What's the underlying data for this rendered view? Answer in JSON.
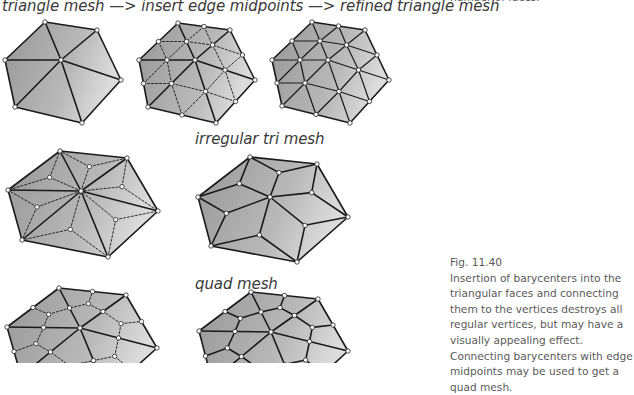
{
  "figure": {
    "title": "triangle mesh —> insert edge midpoints —> refined triangle mesh",
    "label_irregular": "irregular tri mesh",
    "label_quad": "quad mesh",
    "caption_top_fragment": "number of faces.",
    "caption_number": "Fig. 11.40",
    "caption_text": "Insertion of barycenters into the triangular faces and connecting them to the vertices destroys all regular vertices, but may have a visually appealing effect. Connecting barycenters with edge midpoints may be used to get a quad mesh.",
    "colors": {
      "face_dark": "#9a9a9a",
      "face_light": "#d6d6d6",
      "edge": "#1a1a1a",
      "vertex_fill": "#ffffff"
    }
  },
  "meshes": [
    {
      "name": "triangle-mesh",
      "type": "tri",
      "center": [
        61,
        60
      ],
      "hex": [
        [
          45,
          22
        ],
        [
          97,
          30
        ],
        [
          121,
          80
        ],
        [
          82,
          123
        ],
        [
          15,
          107
        ],
        [
          5,
          60
        ]
      ]
    },
    {
      "name": "midpoint-mesh",
      "type": "mid",
      "center": [
        195,
        60
      ],
      "hex": [
        [
          178,
          23
        ],
        [
          230,
          30
        ],
        [
          255,
          80
        ],
        [
          216,
          123
        ],
        [
          148,
          107
        ],
        [
          139,
          60
        ]
      ]
    },
    {
      "name": "refined-triangle-mesh",
      "type": "refined",
      "center": [
        328,
        60
      ],
      "hex": [
        [
          312,
          22
        ],
        [
          365,
          30
        ],
        [
          389,
          80
        ],
        [
          350,
          123
        ],
        [
          282,
          106
        ],
        [
          272,
          60
        ]
      ]
    },
    {
      "name": "barycenter-dashed-mesh",
      "type": "bary-dashed",
      "center": [
        81,
        191
      ],
      "hex": [
        [
          60,
          151
        ],
        [
          127,
          158
        ],
        [
          158,
          211
        ],
        [
          108,
          257
        ],
        [
          22,
          240
        ],
        [
          8,
          190
        ]
      ]
    },
    {
      "name": "irregular-tri-mesh",
      "type": "bary",
      "center": [
        270,
        197
      ],
      "hex": [
        [
          250,
          157
        ],
        [
          317,
          164
        ],
        [
          348,
          217
        ],
        [
          297,
          262
        ],
        [
          211,
          246
        ],
        [
          198,
          197
        ]
      ]
    },
    {
      "name": "quad-dashed-mesh",
      "type": "quad-dashed",
      "center": [
        80,
        328
      ],
      "hex": [
        [
          59,
          288
        ],
        [
          126,
          295
        ],
        [
          157,
          348
        ],
        [
          107,
          393
        ],
        [
          21,
          376
        ],
        [
          7,
          327
        ]
      ]
    },
    {
      "name": "quad-mesh",
      "type": "quad",
      "center": [
        271,
        332
      ],
      "hex": [
        [
          251,
          292
        ],
        [
          318,
          299
        ],
        [
          348,
          351
        ],
        [
          298,
          397
        ],
        [
          212,
          381
        ],
        [
          199,
          331
        ]
      ]
    }
  ]
}
